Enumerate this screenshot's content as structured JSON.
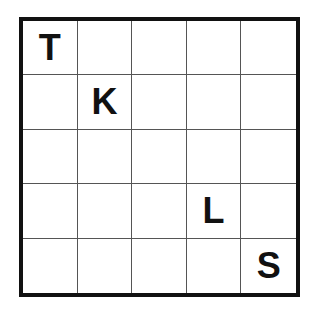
{
  "puzzle": {
    "rows": 5,
    "cols": 5,
    "grid": [
      [
        "T",
        "",
        "",
        "",
        ""
      ],
      [
        "",
        "K",
        "",
        "",
        ""
      ],
      [
        "",
        "",
        "",
        "",
        ""
      ],
      [
        "",
        "",
        "",
        "L",
        ""
      ],
      [
        "",
        "",
        "",
        "",
        "S"
      ]
    ]
  }
}
